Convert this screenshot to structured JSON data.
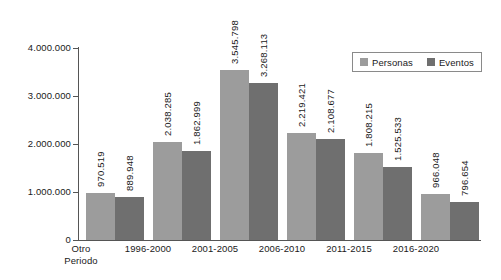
{
  "chart_data": {
    "type": "bar",
    "title": "",
    "subtitle": "",
    "xlabel": "",
    "ylabel": "",
    "grid": false,
    "legend_position": "top-right",
    "categories": [
      "Otro\nPeriodo",
      "1996-2000",
      "2001-2005",
      "2006-2010",
      "2011-2015",
      "2016-2020"
    ],
    "ylim": [
      0,
      4000000
    ],
    "yticks": [
      0,
      1000000,
      2000000,
      3000000,
      4000000
    ],
    "ytick_labels": [
      "0",
      "1.000.000",
      "2.000.000",
      "3.000.000",
      "4.000.000"
    ],
    "series": [
      {
        "name": "Personas",
        "color": "#9c9c9c",
        "values": [
          970519,
          2038285,
          3545798,
          2219421,
          1808215,
          966048
        ],
        "labels": [
          "970.519",
          "2.038.285",
          "3.545.798",
          "2.219.421",
          "1.808.215",
          "966.048"
        ]
      },
      {
        "name": "Eventos",
        "color": "#6f6f6f",
        "values": [
          889948,
          1862999,
          3268113,
          2108677,
          1525533,
          796654
        ],
        "labels": [
          "889.948",
          "1.862.999",
          "3.268.113",
          "2.108.677",
          "1.525.533",
          "796.654"
        ]
      }
    ]
  },
  "categories_display": [
    {
      "line1": "Otro",
      "line2": "Periodo"
    },
    {
      "line1": "1996-2000",
      "line2": ""
    },
    {
      "line1": "2001-2005",
      "line2": ""
    },
    {
      "line1": "2006-2010",
      "line2": ""
    },
    {
      "line1": "2011-2015",
      "line2": ""
    },
    {
      "line1": "2016-2020",
      "line2": ""
    }
  ],
  "legend": {
    "items": [
      {
        "label": "Personas",
        "color": "#9c9c9c"
      },
      {
        "label": "Eventos",
        "color": "#6f6f6f"
      }
    ]
  },
  "axis": {
    "y_labels": [
      "4.000.000",
      "3.000.000",
      "2.000.000",
      "1.000.000",
      "0"
    ]
  }
}
